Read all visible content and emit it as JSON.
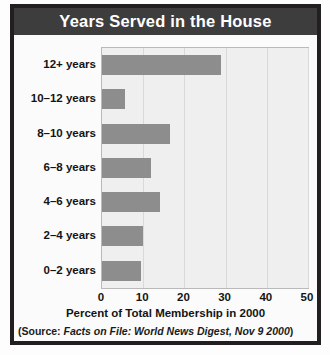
{
  "figure": {
    "title": "Years Served in the House",
    "source_prefix": "(Source:",
    "source_italic": "Facts on File: World News Digest, Nov 9 2000",
    "source_suffix": ")"
  },
  "colors": {
    "title_bar": "#3d3d3d",
    "title_text": "#ffffff",
    "frame": "#231f20",
    "bar": "#8d8d8d",
    "plot_bg": "#efefef",
    "gridline": "#d9d9d9"
  },
  "chart_data": {
    "type": "bar",
    "orientation": "horizontal",
    "title": "Years Served in the House",
    "xlabel": "Percent of Total Membership in 2000",
    "ylabel": "",
    "categories": [
      "12+ years",
      "10–12 years",
      "8–10 years",
      "6–8 years",
      "4–6 years",
      "2–4 years",
      "0–2 years"
    ],
    "values": [
      29,
      5.5,
      16.5,
      12,
      14,
      10,
      9.5
    ],
    "xlim": [
      0,
      50
    ],
    "xticks": [
      0,
      10,
      20,
      30,
      40,
      50
    ],
    "xtick_labels": [
      "0",
      "10",
      "20",
      "30",
      "40",
      "50"
    ],
    "grid": "vertical",
    "legend": "none",
    "source": "(Source: Facts on File: World News Digest, Nov 9 2000)"
  }
}
